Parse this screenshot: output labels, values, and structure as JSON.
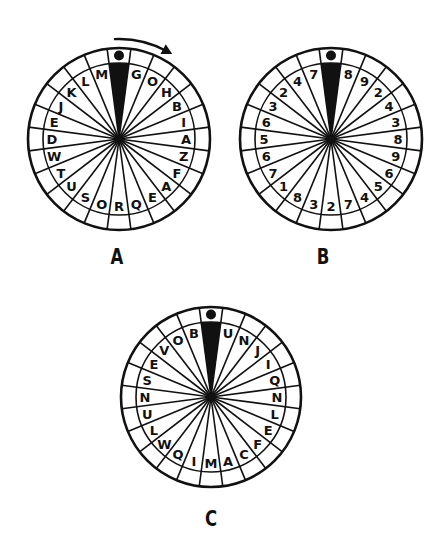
{
  "puzzle": {
    "segments": 24,
    "ink_color": "#111111",
    "background": "#ffffff",
    "wheels": [
      {
        "id": "A",
        "label": "A",
        "center": [
          119,
          139
        ],
        "outer_radius": 91,
        "inner_radius": 76,
        "label_pos": [
          117,
          258
        ],
        "has_arrow": true,
        "symbols": [
          "G",
          "O",
          "H",
          "B",
          "I",
          "A",
          "Z",
          "F",
          "A",
          "E",
          "Q",
          "R",
          "O",
          "S",
          "U",
          "T",
          "W",
          "D",
          "E",
          "J",
          "K",
          "L",
          "M"
        ]
      },
      {
        "id": "B",
        "label": "B",
        "center": [
          331,
          139
        ],
        "outer_radius": 91,
        "inner_radius": 76,
        "label_pos": [
          323,
          258
        ],
        "has_arrow": false,
        "symbols": [
          "8",
          "9",
          "2",
          "4",
          "3",
          "8",
          "9",
          "6",
          "5",
          "4",
          "7",
          "2",
          "3",
          "8",
          "1",
          "7",
          "6",
          "5",
          "6",
          "3",
          "2",
          "4",
          "7"
        ]
      },
      {
        "id": "C",
        "label": "C",
        "center": [
          211,
          397
        ],
        "outer_radius": 90,
        "inner_radius": 75,
        "label_pos": [
          211,
          520
        ],
        "has_arrow": false,
        "symbols": [
          "U",
          "N",
          "J",
          "I",
          "Q",
          "N",
          "L",
          "E",
          "F",
          "C",
          "A",
          "M",
          "I",
          "Q",
          "W",
          "L",
          "U",
          "N",
          "S",
          "E",
          "V",
          "O",
          "B"
        ]
      }
    ],
    "pointer": {
      "icon": "dot-marker-icon",
      "wedge": "black-pointer-wedge"
    },
    "arrow": {
      "icon": "clockwise-arrow-icon",
      "direction": "clockwise"
    }
  }
}
